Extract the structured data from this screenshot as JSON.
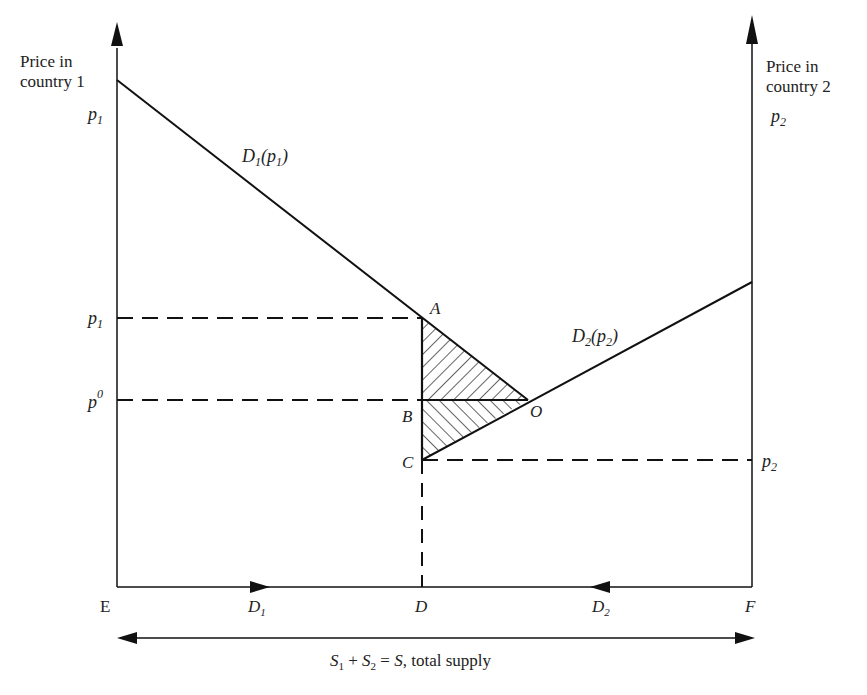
{
  "axes": {
    "left_axis_title_line1": "Price in",
    "left_axis_title_line2": "country 1",
    "left_axis_var": "p",
    "left_axis_var_sub": "1",
    "right_axis_title_line1": "Price in",
    "right_axis_title_line2": "country 2",
    "right_axis_var": "p",
    "right_axis_var_sub": "2"
  },
  "curves": {
    "d1_label_main": "D",
    "d1_label_sub": "1",
    "d1_label_arg": "(p",
    "d1_label_arg_sub": "1",
    "d1_label_close": ")",
    "d2_label_main": "D",
    "d2_label_sub": "2",
    "d2_label_arg": "(p",
    "d2_label_arg_sub": "2",
    "d2_label_close": ")"
  },
  "price_levels": {
    "p1_var": "p",
    "p1_sub": "1",
    "p0_var": "p",
    "p0_sup": "0",
    "p2_var": "p",
    "p2_sub": "2"
  },
  "points": {
    "A": "A",
    "B": "B",
    "C": "C",
    "O": "O"
  },
  "baseline": {
    "E": "E",
    "D1_main": "D",
    "D1_sub": "1",
    "D": "D",
    "D2_main": "D",
    "D2_sub": "2",
    "F": "F"
  },
  "supply": {
    "s1": "S",
    "s1_sub": "1",
    "plus": " + ",
    "s2": "S",
    "s2_sub": "2",
    "eq": " = ",
    "s": "S",
    "rest": ", total supply"
  },
  "colors": {
    "ink": "#111111",
    "background": "#ffffff"
  }
}
